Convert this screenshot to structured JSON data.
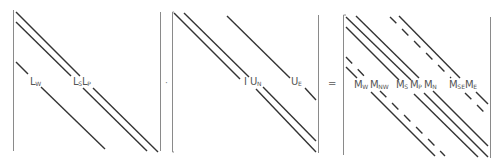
{
  "equation": {
    "description": "L · U = M sparse band-matrix factorization",
    "operator_multiply": "·",
    "operator_equals": "="
  },
  "colors": {
    "diagonal_line": "#333333",
    "bracket_line": "#888888",
    "label_text": "#555555"
  },
  "matrices": [
    {
      "name": "L",
      "diagonals": [
        {
          "id": "L_W",
          "label": "L",
          "sub": "W",
          "style": "solid"
        },
        {
          "id": "L_S",
          "label": "L",
          "sub": "S",
          "style": "solid"
        },
        {
          "id": "L_P",
          "label": "L",
          "sub": "P",
          "style": "solid"
        }
      ]
    },
    {
      "name": "U",
      "diagonals": [
        {
          "id": "I",
          "label": "I",
          "sub": "",
          "style": "solid"
        },
        {
          "id": "U_N",
          "label": "U",
          "sub": "N",
          "style": "solid"
        },
        {
          "id": "U_E",
          "label": "U",
          "sub": "E",
          "style": "solid"
        }
      ]
    },
    {
      "name": "M",
      "diagonals": [
        {
          "id": "M_W",
          "label": "M",
          "sub": "W",
          "style": "solid"
        },
        {
          "id": "M_NW",
          "label": "M",
          "sub": "NW",
          "style": "dashed"
        },
        {
          "id": "M_S",
          "label": "M",
          "sub": "S",
          "style": "solid"
        },
        {
          "id": "M_P",
          "label": "M",
          "sub": "P",
          "style": "solid"
        },
        {
          "id": "M_N",
          "label": "M",
          "sub": "N",
          "style": "solid"
        },
        {
          "id": "M_SE",
          "label": "M",
          "sub": "SE",
          "style": "dashed"
        },
        {
          "id": "M_E",
          "label": "M",
          "sub": "E",
          "style": "solid"
        }
      ]
    }
  ]
}
